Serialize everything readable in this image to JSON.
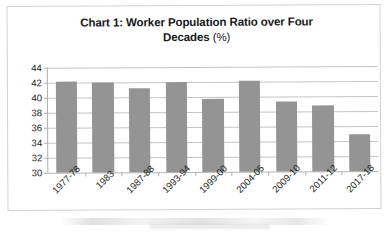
{
  "chart_data": {
    "type": "bar",
    "title": "Chart 1: Worker Population Ratio over Four Decades (%)",
    "title_line1": "Chart 1: Worker Population Ratio over Four",
    "title_line2_bold": "Decades",
    "title_line2_unit": "(%)",
    "xlabel": "",
    "ylabel": "",
    "ylim": [
      30,
      44
    ],
    "ytick_step": 2,
    "ytick_labels": [
      "44",
      "42",
      "40",
      "38",
      "36",
      "34",
      "32",
      "30"
    ],
    "ytick_values": [
      44,
      42,
      40,
      38,
      36,
      34,
      32,
      30
    ],
    "grid": true,
    "legend": false,
    "bar_color": "#949494",
    "gridline_color": "#c4c4c4",
    "axis_color": "#b0b0b0",
    "categories": [
      "1977-78",
      "1983",
      "1987-88",
      "1993-94",
      "1999-00",
      "2004-05",
      "2009-10",
      "2011-12",
      "2017-18"
    ],
    "values": [
      42.2,
      42.0,
      41.2,
      42.0,
      39.8,
      42.1,
      39.4,
      38.8,
      34.9
    ],
    "series": [
      {
        "name": "Worker Population Ratio",
        "values": [
          42.2,
          42.0,
          41.2,
          42.0,
          39.8,
          42.1,
          39.4,
          38.8,
          34.9
        ]
      }
    ]
  }
}
